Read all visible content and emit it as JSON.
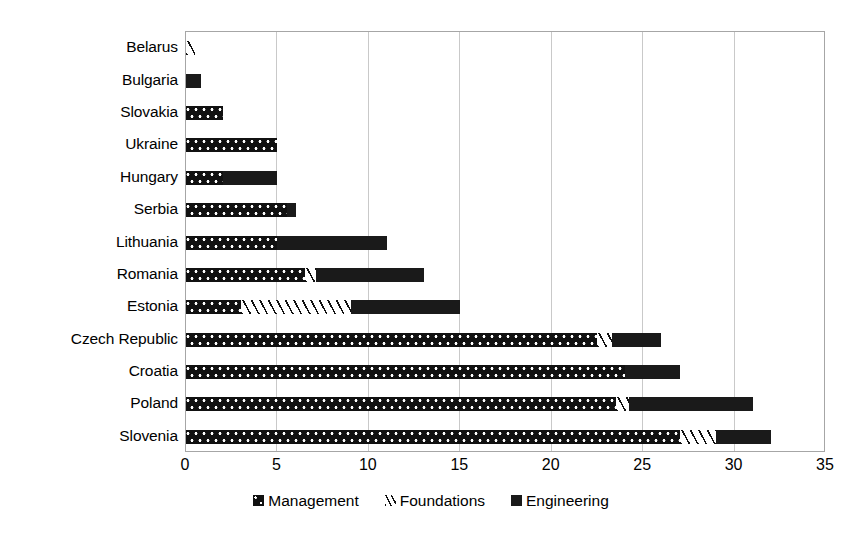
{
  "chart_data": {
    "type": "bar",
    "orientation": "horizontal",
    "stacked": true,
    "title": "",
    "xlabel": "",
    "ylabel": "",
    "xlim": [
      0,
      35
    ],
    "xticks": [
      "0",
      "5",
      "10",
      "15",
      "20",
      "25",
      "30",
      "35"
    ],
    "xtick_values": [
      0,
      5,
      10,
      15,
      20,
      25,
      30,
      35
    ],
    "grid": "vertical",
    "legend_position": "bottom",
    "categories": [
      "Belarus",
      "Bulgaria",
      "Slovakia",
      "Ukraine",
      "Hungary",
      "Serbia",
      "Lithuania",
      "Romania",
      "Estonia",
      "Czech Republic",
      "Croatia",
      "Poland",
      "Slovenia"
    ],
    "series": [
      {
        "name": "Management",
        "pattern": "cross-hatch",
        "color": "#111111",
        "values": [
          0,
          0,
          2.0,
          5.0,
          2.0,
          5.5,
          5.0,
          6.5,
          3.0,
          22.5,
          24.0,
          23.5,
          27.0
        ]
      },
      {
        "name": "Foundations",
        "pattern": "diagonal-stripes",
        "color": "#111111",
        "values": [
          0.5,
          0,
          0,
          0,
          0,
          0,
          0,
          0.6,
          6.0,
          0.8,
          0,
          0.7,
          2.0
        ]
      },
      {
        "name": "Engineering",
        "pattern": "solid",
        "color": "#1a1a1a",
        "values": [
          0,
          0.8,
          0,
          0,
          3.0,
          0.5,
          6.0,
          5.9,
          6.0,
          2.7,
          3.0,
          6.8,
          3.0
        ]
      }
    ],
    "totals": [
      0.5,
      0.8,
      2.0,
      5.0,
      5.0,
      6.0,
      11.0,
      13.0,
      15.0,
      26.1,
      27.0,
      31.0,
      32.0
    ]
  },
  "legend": {
    "items": [
      {
        "label": "Management",
        "swatch": "cross-hatch-swatch"
      },
      {
        "label": "Foundations",
        "swatch": "diagonal-stripe-swatch"
      },
      {
        "label": "Engineering",
        "swatch": "solid-swatch"
      }
    ]
  },
  "colors": {
    "bar_dark": "#111111",
    "gridline": "#c9c9c9",
    "axis_border": "#a6a6a6",
    "background": "#ffffff"
  }
}
